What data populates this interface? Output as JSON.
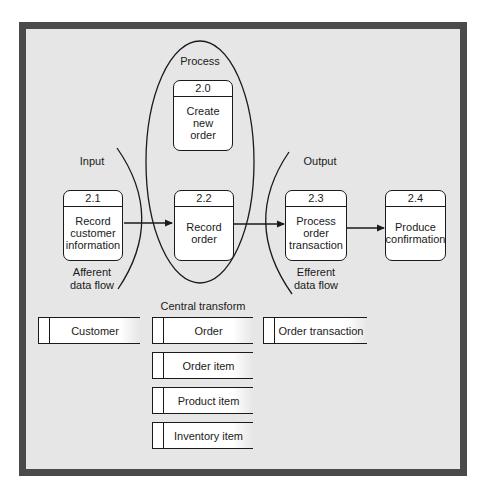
{
  "colors": {
    "frame_border": "#4a4a4a",
    "background": "#e6e6e6",
    "box_fill": "#ffffff",
    "stroke": "#1a1a1a"
  },
  "regions": {
    "process": "Process",
    "input": "Input",
    "output": "Output",
    "afferent": "Afferent\ndata flow",
    "efferent": "Efferent\ndata flow",
    "central": "Central transform"
  },
  "processes": [
    {
      "id": "2.0",
      "name": "Create new\norder"
    },
    {
      "id": "2.1",
      "name": "Record\ncustomer\ninformation"
    },
    {
      "id": "2.2",
      "name": "Record\norder"
    },
    {
      "id": "2.3",
      "name": "Process\norder\ntransaction"
    },
    {
      "id": "2.4",
      "name": "Produce\nconfirmation"
    }
  ],
  "data_stores": [
    {
      "name": "Customer"
    },
    {
      "name": "Order"
    },
    {
      "name": "Order transaction"
    },
    {
      "name": "Order item"
    },
    {
      "name": "Product item"
    },
    {
      "name": "Inventory item"
    }
  ],
  "flows": [
    {
      "from": "2.1",
      "to": "2.2"
    },
    {
      "from": "2.2",
      "to": "2.3"
    },
    {
      "from": "2.3",
      "to": "2.4"
    }
  ]
}
